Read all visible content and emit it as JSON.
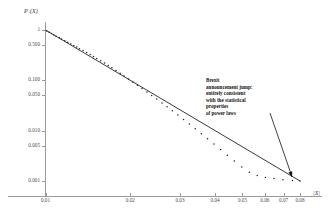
{
  "chart_data": {
    "type": "scatter",
    "title": "",
    "subtitle": "",
    "xlabel": "|X|",
    "ylabel": "P>(X)",
    "xscale": "log",
    "yscale": "log",
    "grid": false,
    "legend": null,
    "xlim": [
      0.009,
      0.09
    ],
    "ylim": [
      0.0008,
      1.3
    ],
    "xticks": [
      0.01,
      0.02,
      0.03,
      0.04,
      0.05,
      0.06,
      0.07,
      0.08
    ],
    "xtick_labels": [
      "0.01",
      "0.02",
      "0.03",
      "0.04",
      "0.05",
      "0.06",
      "0.07",
      "0.08"
    ],
    "yticks": [
      1,
      0.5,
      0.1,
      0.05,
      0.01,
      0.005,
      0.001
    ],
    "ytick_labels": [
      "1",
      "0.500",
      "0.100",
      "0.050",
      "0.010",
      "0.005",
      "0.001"
    ],
    "series": [
      {
        "name": "empirical survival function",
        "type": "scatter",
        "marker": "dot",
        "color": "#222222",
        "x": [
          0.0101,
          0.0103,
          0.0105,
          0.0107,
          0.0109,
          0.0112,
          0.0114,
          0.0117,
          0.012,
          0.0123,
          0.0126,
          0.0129,
          0.0132,
          0.0136,
          0.014,
          0.0144,
          0.0148,
          0.0152,
          0.0157,
          0.0162,
          0.0167,
          0.0172,
          0.0178,
          0.0184,
          0.019,
          0.0197,
          0.0204,
          0.0212,
          0.022,
          0.0229,
          0.0238,
          0.0248,
          0.0259,
          0.027,
          0.0282,
          0.0295,
          0.0309,
          0.0324,
          0.034,
          0.0357,
          0.0376,
          0.0396,
          0.0418,
          0.0442,
          0.0468,
          0.0497,
          0.0529,
          0.0564,
          0.0603,
          0.0647,
          0.0696,
          0.0752,
          0.08
        ],
        "y": [
          0.96,
          0.905,
          0.852,
          0.8,
          0.754,
          0.7,
          0.66,
          0.612,
          0.57,
          0.53,
          0.492,
          0.458,
          0.426,
          0.392,
          0.358,
          0.327,
          0.298,
          0.272,
          0.245,
          0.22,
          0.198,
          0.178,
          0.157,
          0.139,
          0.122,
          0.106,
          0.0925,
          0.0795,
          0.0685,
          0.0588,
          0.0502,
          0.0424,
          0.0355,
          0.03,
          0.0249,
          0.0205,
          0.0166,
          0.0135,
          0.0109,
          0.00872,
          0.0069,
          0.00542,
          0.00422,
          0.00325,
          0.00249,
          0.00189,
          0.00149,
          0.00128,
          0.00118,
          0.00112,
          0.00106,
          0.00102,
          0.001
        ]
      },
      {
        "name": "power-law fit",
        "type": "line",
        "color": "#222222",
        "x": [
          0.01,
          0.08
        ],
        "y": [
          1.0,
          0.001
        ],
        "slope_loglog": -3.32
      }
    ],
    "annotations": [
      {
        "name": "brexit-annotation",
        "lines": [
          "Brexit",
          "announcement jump:",
          "entirely consistent",
          "with the statistical",
          "properties",
          "of power laws"
        ],
        "arrow_from": [
          0.052,
          0.022
        ],
        "arrow_to": [
          0.075,
          0.0012
        ]
      }
    ]
  },
  "axes": {
    "y_title_main": "P",
    "y_title_sub": ">",
    "y_title_arg": "(X)",
    "x_title": "|X|"
  }
}
